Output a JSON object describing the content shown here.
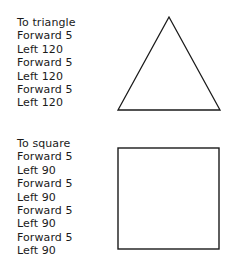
{
  "procedures": [
    {
      "name": "triangle",
      "lines": [
        "To triangle",
        "Forward 5",
        "Left 120",
        "Forward 5",
        "Left 120",
        "Forward 5",
        "Left 120"
      ],
      "shape": {
        "type": "triangle",
        "points": [
          [
            169,
            17
          ],
          [
            118,
            110
          ],
          [
            220,
            110
          ]
        ]
      }
    },
    {
      "name": "square",
      "lines": [
        "To square",
        "Forward 5",
        "Left 90",
        "Forward 5",
        "Left 90",
        "Forward 5",
        "Left 90",
        "Forward 5",
        "Left 90"
      ],
      "shape": {
        "type": "square",
        "x": 118,
        "y": 148,
        "width": 101,
        "height": 101
      }
    }
  ],
  "colors": {
    "stroke": "#1a1a1a",
    "background": "#ffffff"
  }
}
